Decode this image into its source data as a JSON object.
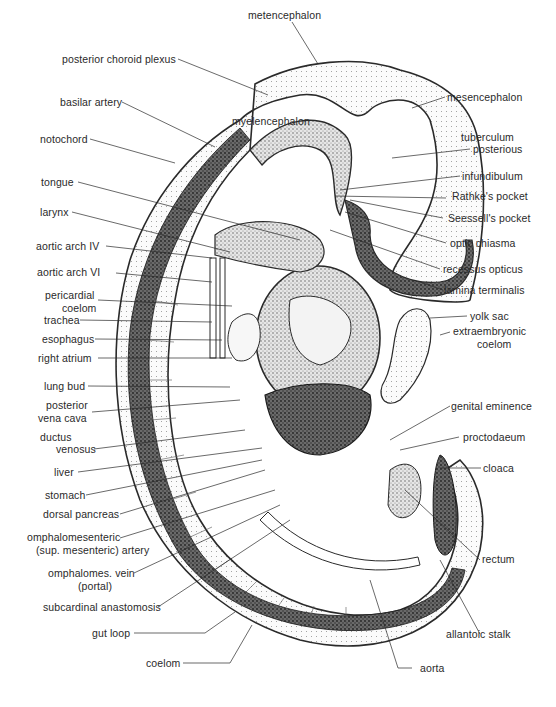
{
  "diagram": {
    "colors": {
      "ink": "#2a2a2a",
      "background": "#ffffff",
      "dark_stipple": "#3a3a3a",
      "light_stipple": "#cfcfcf",
      "mid_stipple": "#8a8a8a"
    },
    "labels_left": [
      {
        "id": "posterior-choroid-plexus",
        "text": "posterior choroid plexus"
      },
      {
        "id": "basilar-artery",
        "text": "basilar artery"
      },
      {
        "id": "notochord",
        "text": "notochord"
      },
      {
        "id": "tongue",
        "text": "tongue"
      },
      {
        "id": "larynx",
        "text": "larynx"
      },
      {
        "id": "aortic-arch-iv",
        "text": "aortic arch IV"
      },
      {
        "id": "aortic-arch-vi",
        "text": "aortic arch VI"
      },
      {
        "id": "pericardial-coelom",
        "line1": "pericardial",
        "line2": "coelom"
      },
      {
        "id": "trachea",
        "text": "trachea"
      },
      {
        "id": "esophagus",
        "text": "esophagus"
      },
      {
        "id": "right-atrium",
        "text": "right atrium"
      },
      {
        "id": "lung-bud",
        "text": "lung bud"
      },
      {
        "id": "posterior-vena-cava",
        "line1": "posterior",
        "line2": "vena cava"
      },
      {
        "id": "ductus-venosus",
        "line1": "ductus",
        "line2": "venosus"
      },
      {
        "id": "liver",
        "text": "liver"
      },
      {
        "id": "stomach",
        "text": "stomach"
      },
      {
        "id": "dorsal-pancreas",
        "text": "dorsal pancreas"
      },
      {
        "id": "omphalomesenteric-artery",
        "line1": "omphalomesenteric",
        "line2": "(sup. mesenteric) artery"
      },
      {
        "id": "omphalomes-vein",
        "line1": "omphalomes. vein",
        "line2": "(portal)"
      },
      {
        "id": "subcardinal-anastomosis",
        "text": "subcardinal anastomosis"
      },
      {
        "id": "gut-loop",
        "text": "gut loop"
      },
      {
        "id": "coelom",
        "text": "coelom"
      }
    ],
    "labels_top": [
      {
        "id": "metencephalon",
        "text": "metencephalon"
      },
      {
        "id": "myelencephalon",
        "text": "myelencephalon"
      }
    ],
    "labels_right": [
      {
        "id": "mesencephalon",
        "text": "mesencephalon"
      },
      {
        "id": "tuberculum-posterious",
        "line1": "tuberculum",
        "line2": "posterious"
      },
      {
        "id": "infundibulum",
        "text": "infundibulum"
      },
      {
        "id": "rathkes-pocket",
        "text": "Rathke's pocket"
      },
      {
        "id": "seessells-pocket",
        "text": "Seessell's pocket"
      },
      {
        "id": "optic-chiasma",
        "text": "optic chiasma"
      },
      {
        "id": "recessus-opticus",
        "text": "recessus opticus"
      },
      {
        "id": "lamina-terminalis",
        "text": "lamina terminalis"
      },
      {
        "id": "yolk-sac",
        "text": "yolk sac"
      },
      {
        "id": "extraembryonic-coelom",
        "line1": "extraembryonic",
        "line2": "coelom"
      },
      {
        "id": "genital-eminence",
        "text": "genital eminence"
      },
      {
        "id": "proctodaeum",
        "text": "proctodaeum"
      },
      {
        "id": "cloaca",
        "text": "cloaca"
      },
      {
        "id": "rectum",
        "text": "rectum"
      },
      {
        "id": "allantoic-stalk",
        "text": "allantoic stalk"
      },
      {
        "id": "aorta",
        "text": "aorta"
      }
    ]
  }
}
